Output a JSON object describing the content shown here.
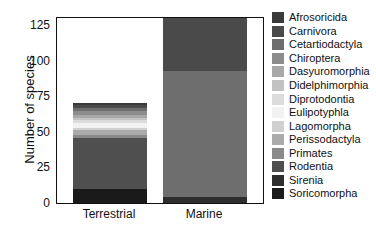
{
  "chart_data": {
    "type": "bar",
    "title": "",
    "subtitle": "",
    "xlabel": "",
    "ylabel": "Number of species",
    "categories": [
      "Terrestrial",
      "Marine"
    ],
    "ylim": [
      0,
      130
    ],
    "yticks": [
      0,
      25,
      50,
      75,
      100,
      125
    ],
    "ytick_labels": [
      "0",
      "25",
      "50",
      "75",
      "100",
      "125"
    ],
    "grid": false,
    "stacked": true,
    "legend_position": "right",
    "totals": [
      70,
      130
    ],
    "series": [
      {
        "name": "Afrosoricida",
        "color": "#3a3a3a",
        "values": [
          1,
          0
        ]
      },
      {
        "name": "Carnivora",
        "color": "#4a4a4a",
        "values": [
          2,
          37
        ]
      },
      {
        "name": "Cetartiodactyla",
        "color": "#6e6e6e",
        "values": [
          2,
          89
        ]
      },
      {
        "name": "Chiroptera",
        "color": "#8c8c8c",
        "values": [
          3,
          0
        ]
      },
      {
        "name": "Dasyuromorphia",
        "color": "#a8a8a8",
        "values": [
          2,
          0
        ]
      },
      {
        "name": "Didelphimorphia",
        "color": "#c2c2c2",
        "values": [
          2,
          0
        ]
      },
      {
        "name": "Diprotodontia",
        "color": "#dcdcdc",
        "values": [
          2,
          0
        ]
      },
      {
        "name": "Eulipotyphla",
        "color": "#f2f2f2",
        "values": [
          3,
          0
        ]
      },
      {
        "name": "Lagomorpha",
        "color": "#d0d0d0",
        "values": [
          2,
          0
        ]
      },
      {
        "name": "Perissodactyla",
        "color": "#ababab",
        "values": [
          3,
          0
        ]
      },
      {
        "name": "Primates",
        "color": "#8a8a8a",
        "values": [
          2,
          0
        ]
      },
      {
        "name": "Rodentia",
        "color": "#4f4f4f",
        "values": [
          36,
          0
        ]
      },
      {
        "name": "Sirenia",
        "color": "#2e2e2e",
        "values": [
          0,
          4
        ]
      },
      {
        "name": "Soricomorpha",
        "color": "#1a1a1a",
        "values": [
          10,
          0
        ]
      }
    ]
  },
  "legend": {
    "items": [
      {
        "label": "Afrosoricida"
      },
      {
        "label": "Carnivora"
      },
      {
        "label": "Cetartiodactyla"
      },
      {
        "label": "Chiroptera"
      },
      {
        "label": "Dasyuromorphia"
      },
      {
        "label": "Didelphimorphia"
      },
      {
        "label": "Diprotodontia"
      },
      {
        "label": "Eulipotyphla"
      },
      {
        "label": "Lagomorpha"
      },
      {
        "label": "Perissodactyla"
      },
      {
        "label": "Primates"
      },
      {
        "label": "Rodentia"
      },
      {
        "label": "Sirenia"
      },
      {
        "label": "Soricomorpha"
      }
    ]
  },
  "axes": {
    "y_title": "Number of species"
  }
}
